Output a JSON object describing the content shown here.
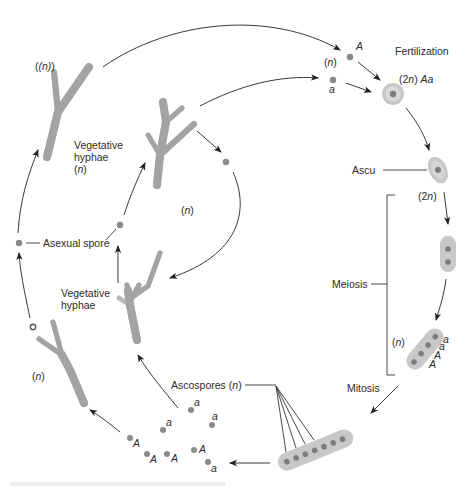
{
  "diagram": {
    "type": "life-cycle",
    "labels": {
      "fertilization": "Fertilization",
      "zygote_ploidy": "(2n) Aa",
      "gametes_ploidy": "(n)",
      "allele_A": "A",
      "allele_a": "a",
      "ascus": "Ascu",
      "ascus_ploidy": "(2n)",
      "meiosis": "Meiosis",
      "meiosis_products_ploidy": "(n)",
      "mitosis": "Mitosis",
      "ascospores": "Ascospores (n)",
      "asexual_spore": "Asexual spore",
      "vegetative_hyphae_top": "Vegetative hyphae (n)",
      "veg_line1": "Vegetative",
      "veg_line2": "hyphae",
      "veg_ploidy": "(n)",
      "inner_cycle_ploidy": "(n)",
      "left_hypha_ploidy": "(n)",
      "bottom_left_hypha_ploidy": "(n)"
    },
    "meiosis_ascus_alleles": [
      "a",
      "a",
      "A",
      "A"
    ],
    "ascospore_alleles": [
      "a",
      "a",
      "a",
      "A",
      "A",
      "A",
      "A",
      "a"
    ],
    "caption": ""
  }
}
